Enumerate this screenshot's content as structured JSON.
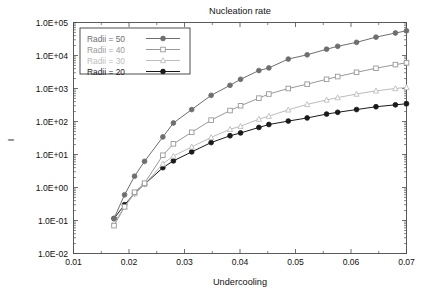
{
  "chart_data": {
    "type": "line",
    "title": "Nucleation rate",
    "xlabel": "Undercooling",
    "ylabel": "I",
    "xscale": "linear",
    "yscale": "log",
    "xlim": [
      0.01,
      0.07
    ],
    "ylim": [
      0.01,
      100000
    ],
    "grid": false,
    "legend_position": "top-left",
    "xticks": [
      0.01,
      0.02,
      0.03,
      0.04,
      0.05,
      0.06,
      0.07
    ],
    "xtick_labels": [
      "0.01",
      "0.02",
      "0.03",
      "0.04",
      "0.05",
      "0.06",
      "0.07"
    ],
    "yticks": [
      0.01,
      0.1,
      1,
      10,
      100,
      1000,
      10000,
      100000
    ],
    "ytick_labels": [
      "1.0E-02",
      "1.0E-01",
      "1.0E+00",
      "1.0E+01",
      "1.0E+02",
      "1.0E+03",
      "1.0E+04",
      "1.0E+05"
    ],
    "series": [
      {
        "name": "Radii = 50",
        "color": "#6e6e6e",
        "marker": "circle-filled",
        "x": [
          0.0173,
          0.0192,
          0.021,
          0.0228,
          0.0261,
          0.028,
          0.0313,
          0.0348,
          0.0382,
          0.0401,
          0.0434,
          0.0452,
          0.0487,
          0.0521,
          0.0556,
          0.0576,
          0.061,
          0.0645,
          0.068,
          0.07
        ],
        "y": [
          0.115,
          0.6,
          2.2,
          6.2,
          34.0,
          90.0,
          230.0,
          620.0,
          1250.0,
          1900.0,
          3500.0,
          4200.0,
          7800.0,
          10500.0,
          15500.0,
          19000.0,
          25000.0,
          36000.0,
          48000.0,
          56000.0
        ]
      },
      {
        "name": "Radii = 40",
        "color": "#999999",
        "marker": "square-open",
        "x": [
          0.0173,
          0.0192,
          0.021,
          0.0228,
          0.0261,
          0.028,
          0.0313,
          0.0348,
          0.0382,
          0.0401,
          0.0434,
          0.0452,
          0.0487,
          0.0521,
          0.0556,
          0.0576,
          0.061,
          0.0645,
          0.068,
          0.07
        ],
        "y": [
          0.07,
          0.26,
          0.72,
          1.35,
          9.5,
          21.0,
          47.0,
          110.0,
          215.0,
          300.0,
          510.0,
          680.0,
          1000.0,
          1350.0,
          1900.0,
          2300.0,
          3100.0,
          4100.0,
          5300.0,
          6000.0
        ]
      },
      {
        "name": "Radii = 30",
        "color": "#bdbdbd",
        "marker": "triangle",
        "x": [
          0.0173,
          0.0192,
          0.021,
          0.0228,
          0.0261,
          0.028,
          0.0313,
          0.0348,
          0.0382,
          0.0401,
          0.0434,
          0.0452,
          0.0487,
          0.0521,
          0.0556,
          0.0576,
          0.061,
          0.0645,
          0.068,
          0.07
        ],
        "y": [
          0.085,
          0.26,
          0.65,
          1.25,
          5.2,
          9.0,
          17.0,
          33.0,
          58.0,
          72.0,
          118.0,
          145.0,
          225.0,
          330.0,
          450.0,
          530.0,
          680.0,
          850.0,
          1000.0,
          1080.0
        ]
      },
      {
        "name": "Radii = 20",
        "color": "#1a1a1a",
        "marker": "circle-filled",
        "x": [
          0.0173,
          0.0192,
          0.021,
          0.0228,
          0.0261,
          0.028,
          0.0313,
          0.0348,
          0.0382,
          0.0401,
          0.0434,
          0.0452,
          0.0487,
          0.0521,
          0.0556,
          0.0576,
          0.061,
          0.0645,
          0.068,
          0.07
        ],
        "y": [
          0.115,
          0.3,
          0.66,
          1.25,
          4.0,
          6.4,
          12.0,
          23.0,
          37.0,
          45.0,
          66.0,
          81.0,
          103.0,
          128.0,
          168.0,
          190.0,
          230.0,
          280.0,
          320.0,
          345.0
        ]
      }
    ]
  },
  "legend": {
    "entries": [
      {
        "label": "Radii = 50"
      },
      {
        "label": "Radii = 40"
      },
      {
        "label": "Radii = 30"
      },
      {
        "label": "Radii = 20"
      }
    ]
  }
}
